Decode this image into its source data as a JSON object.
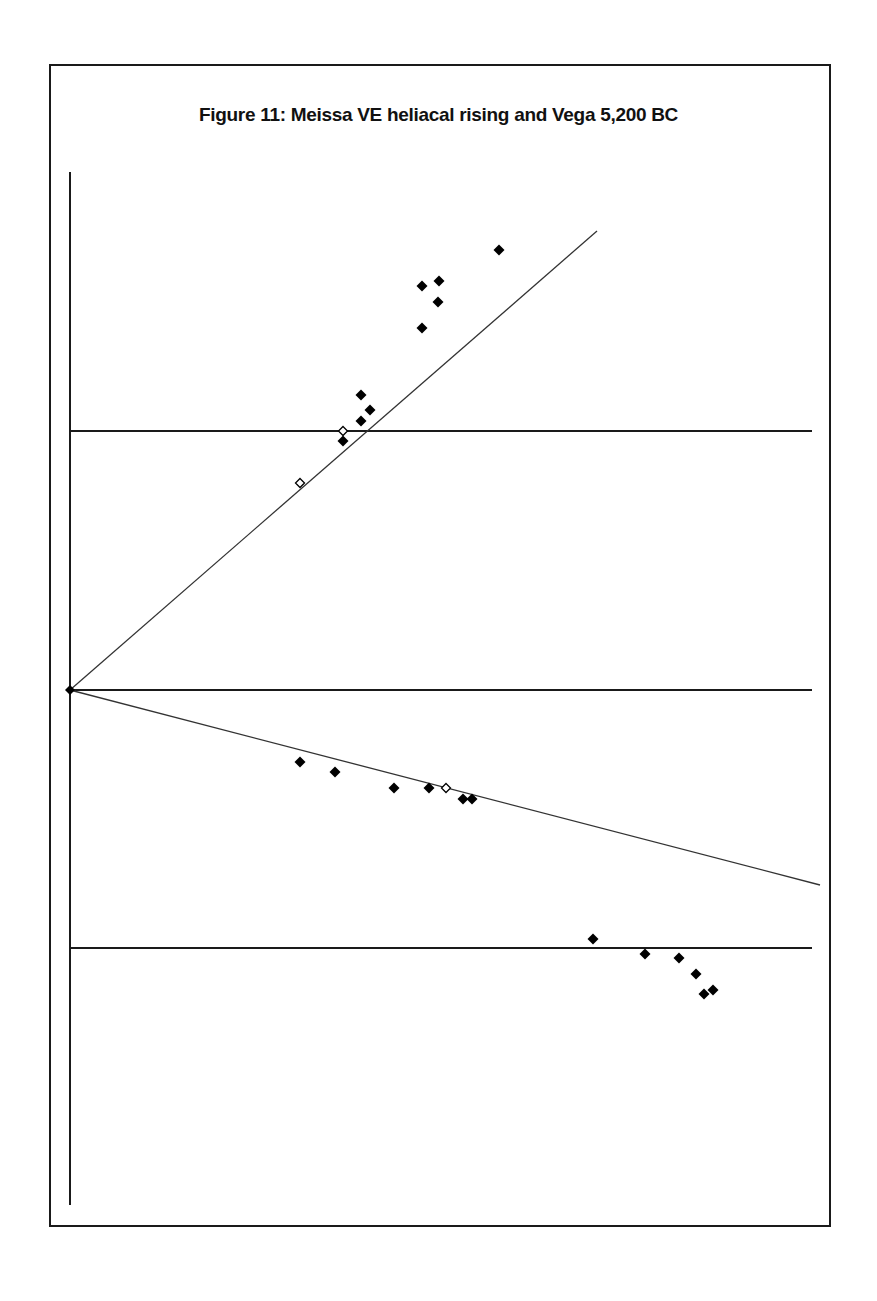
{
  "figure": {
    "title": "Figure 11: Meissa VE heliacal rising and Vega 5,200 BC"
  },
  "colors": {
    "line": "#1a1a1a",
    "marker_filled": "#000000",
    "marker_open_fill": "#ffffff",
    "background": "#ffffff"
  },
  "chart_data": {
    "type": "scatter",
    "title": "Figure 11: Meissa VE heliacal rising and Vega 5,200 BC",
    "xlabel": "",
    "ylabel": "",
    "grid": false,
    "legend": null,
    "axes": {
      "vertical_axis": {
        "x": 70,
        "y1": 172,
        "y2": 1205
      },
      "horizontal_lines": [
        {
          "y": 431,
          "x1": 70,
          "x2": 812
        },
        {
          "y": 690,
          "x1": 70,
          "x2": 812
        },
        {
          "y": 948,
          "x1": 70,
          "x2": 812
        }
      ]
    },
    "reference_lines": [
      {
        "name": "upper-diagonal",
        "x1": 70,
        "y1": 690,
        "x2": 597,
        "y2": 231
      },
      {
        "name": "lower-diagonal",
        "x1": 70,
        "y1": 690,
        "x2": 820,
        "y2": 885
      }
    ],
    "origin_marker": {
      "x": 70,
      "y": 690
    },
    "series": [
      {
        "name": "filled",
        "marker": "diamond-filled",
        "points": [
          [
            499,
            250
          ],
          [
            422,
            286
          ],
          [
            439,
            281
          ],
          [
            438,
            302
          ],
          [
            422,
            328
          ],
          [
            361,
            395
          ],
          [
            370,
            410
          ],
          [
            361,
            421
          ],
          [
            343,
            441
          ],
          [
            300,
            762
          ],
          [
            335,
            772
          ],
          [
            394,
            788
          ],
          [
            429,
            788
          ],
          [
            463,
            799
          ],
          [
            472,
            799
          ],
          [
            593,
            939
          ],
          [
            645,
            954
          ],
          [
            679,
            958
          ],
          [
            696,
            974
          ],
          [
            704,
            994
          ],
          [
            713,
            990
          ]
        ]
      },
      {
        "name": "open",
        "marker": "diamond-open",
        "points": [
          [
            343,
            431
          ],
          [
            300,
            483
          ],
          [
            446,
            788
          ]
        ]
      }
    ]
  }
}
